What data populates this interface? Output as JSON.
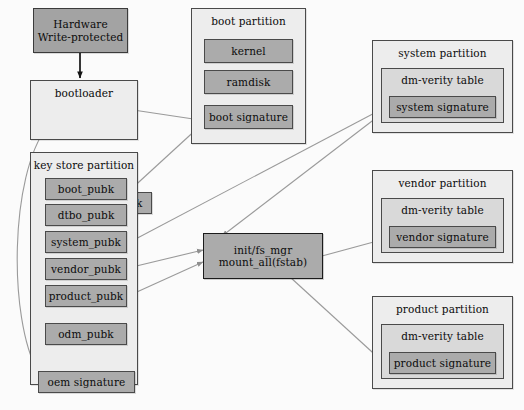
{
  "diagram": {
    "colors": {
      "background": "#fbfbfb",
      "container_fill": "#ededed",
      "block_fill": "#ababab",
      "verity_fill": "#d9d9d9",
      "stroke": "#4a4a4a",
      "wire": "#9a9a9a",
      "wire_dark": "#1b1b1b"
    },
    "hardware": {
      "label": "Hardware\nWrite-protected"
    },
    "bootloader": {
      "title": "bootloader",
      "keys": [
        {
          "label": "oem_pubk"
        }
      ]
    },
    "key_store_partition": {
      "title": "key store partition",
      "keys": [
        {
          "label": "boot_pubk"
        },
        {
          "label": "dtbo_pubk"
        },
        {
          "label": "system_pubk"
        },
        {
          "label": "vendor_pubk"
        },
        {
          "label": "product_pubk"
        },
        {
          "label": "odm_pubk"
        }
      ],
      "signature": {
        "label": "oem signature"
      }
    },
    "boot_partition": {
      "title": "boot partition",
      "items": [
        {
          "label": "kernel"
        },
        {
          "label": "ramdisk"
        },
        {
          "label": "boot signature"
        }
      ]
    },
    "init_node": {
      "label": "init/fs_mgr\nmount_all(fstab)"
    },
    "verified_partitions": [
      {
        "title": "system partition",
        "verity_title": "dm-verity table",
        "signature": "system signature"
      },
      {
        "title": "vendor partition",
        "verity_title": "dm-verity table",
        "signature": "vendor signature"
      },
      {
        "title": "product partition",
        "verity_title": "dm-verity table",
        "signature": "product signature"
      }
    ]
  }
}
